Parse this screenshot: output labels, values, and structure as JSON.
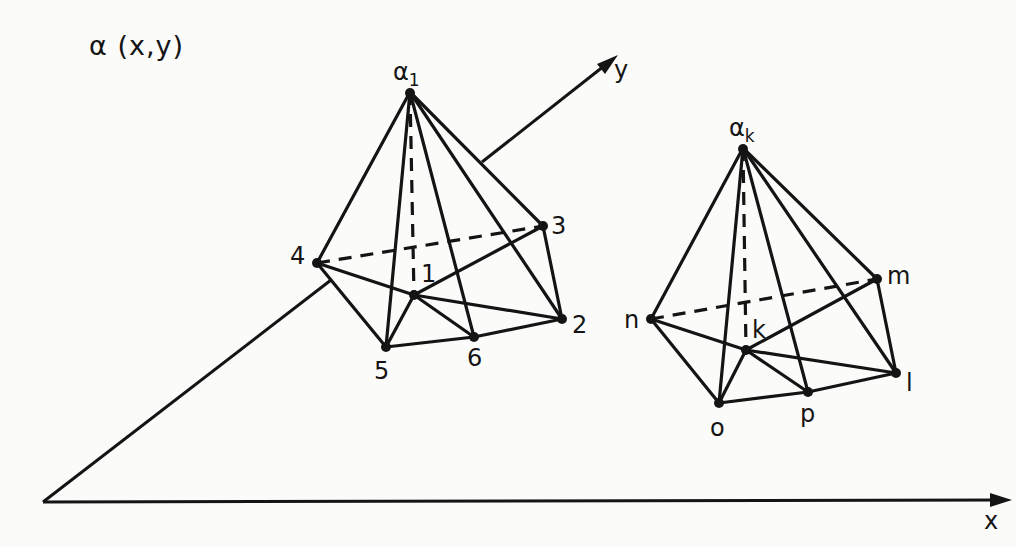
{
  "figure": {
    "function_label": "α (x,y)",
    "axes": {
      "x": {
        "label": "x",
        "origin": [
          43,
          502
        ],
        "tip": [
          1012,
          500
        ]
      },
      "y": {
        "label": "y",
        "origin": [
          43,
          502
        ],
        "tip": [
          618,
          55
        ]
      }
    },
    "pyramids": [
      {
        "apex_label_main": "α",
        "apex_label_sub": "1",
        "apex": [
          410,
          92
        ],
        "center": {
          "label": "1",
          "pos": [
            414,
            295
          ]
        },
        "base_nodes": [
          {
            "label": "2",
            "pos": [
              562,
              319
            ]
          },
          {
            "label": "3",
            "pos": [
              543,
              226
            ]
          },
          {
            "label": "4",
            "pos": [
              317,
              263
            ]
          },
          {
            "label": "5",
            "pos": [
              386,
              347
            ]
          },
          {
            "label": "6",
            "pos": [
              474,
              337
            ]
          }
        ]
      },
      {
        "apex_label_main": "α",
        "apex_label_sub": "k",
        "apex": [
          743,
          148
        ],
        "center": {
          "label": "k",
          "pos": [
            746,
            350
          ]
        },
        "base_nodes": [
          {
            "label": "l",
            "pos": [
              896,
              373
            ]
          },
          {
            "label": "m",
            "pos": [
              877,
              279
            ]
          },
          {
            "label": "n",
            "pos": [
              651,
              319
            ]
          },
          {
            "label": "o",
            "pos": [
              719,
              403
            ]
          },
          {
            "label": "p",
            "pos": [
              808,
              392
            ]
          }
        ]
      }
    ],
    "colors": {
      "ink": "#141414",
      "paper": "#fbfbfa"
    }
  }
}
